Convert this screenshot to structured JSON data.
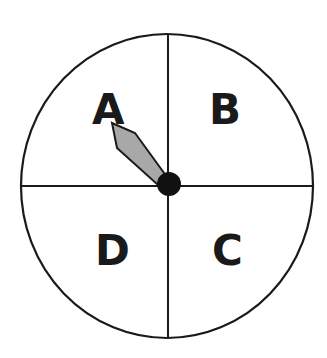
{
  "diagram": {
    "type": "spinner",
    "sections": [
      {
        "label": "A",
        "position": "top-left"
      },
      {
        "label": "B",
        "position": "top-right"
      },
      {
        "label": "C",
        "position": "bottom-right"
      },
      {
        "label": "D",
        "position": "bottom-left"
      }
    ],
    "pointer": {
      "points_to": "A",
      "fill": "#a8a8a8"
    },
    "colors": {
      "line": "#1a1a1a",
      "hub": "#111111",
      "background": "#ffffff"
    }
  }
}
